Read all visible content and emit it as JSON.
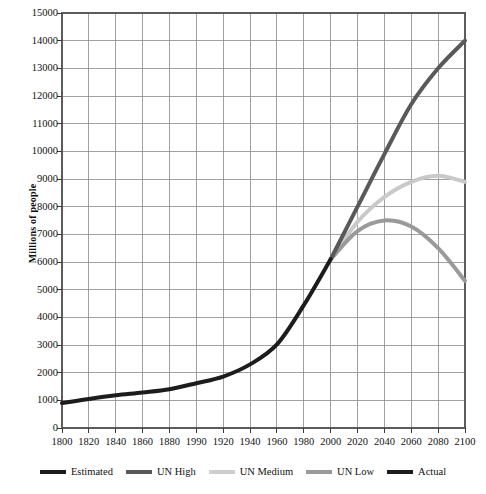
{
  "chart_data": {
    "type": "line",
    "title": "",
    "xlabel": "",
    "ylabel": "Millions of people",
    "xlim": [
      1800,
      2100
    ],
    "ylim": [
      0,
      15000
    ],
    "grid": true,
    "legend_position": "bottom",
    "x_tick_labels": [
      "1800",
      "1820",
      "1840",
      "1860",
      "1880",
      "1990",
      "1920",
      "1940",
      "1960",
      "1980",
      "2000",
      "2020",
      "2040",
      "2060",
      "2080",
      "2100"
    ],
    "x_tick_values": [
      1800,
      1820,
      1840,
      1860,
      1880,
      1900,
      1920,
      1940,
      1960,
      1980,
      2000,
      2020,
      2040,
      2060,
      2080,
      2100
    ],
    "y_tick_labels": [
      "0",
      "1000",
      "2000",
      "3000",
      "4000",
      "5000",
      "6000",
      "7000",
      "8000",
      "9000",
      "10000",
      "11000",
      "12000",
      "13000",
      "14000",
      "15000"
    ],
    "y_tick_values": [
      0,
      1000,
      2000,
      3000,
      4000,
      5000,
      6000,
      7000,
      8000,
      9000,
      10000,
      11000,
      12000,
      13000,
      14000,
      15000
    ],
    "series": [
      {
        "name": "Estimated",
        "color": "#1c1c1c",
        "width": 4,
        "x": [
          1800,
          1820,
          1840,
          1860,
          1880,
          1900,
          1920,
          1940,
          1960,
          1980,
          2000
        ],
        "values": [
          900,
          1050,
          1180,
          1280,
          1400,
          1620,
          1860,
          2300,
          3020,
          4440,
          6100
        ]
      },
      {
        "name": "UN High",
        "color": "#595959",
        "width": 4,
        "x": [
          2000,
          2020,
          2040,
          2060,
          2080,
          2100
        ],
        "values": [
          6100,
          8000,
          9900,
          11700,
          13000,
          14000
        ]
      },
      {
        "name": "UN Medium",
        "color": "#c9c9c9",
        "width": 4,
        "x": [
          2000,
          2020,
          2040,
          2060,
          2080,
          2100
        ],
        "values": [
          6100,
          7450,
          8350,
          8900,
          9120,
          8900
        ]
      },
      {
        "name": "UN Low",
        "color": "#9a9a9a",
        "width": 4,
        "x": [
          2000,
          2020,
          2040,
          2060,
          2080,
          2100
        ],
        "values": [
          6100,
          7120,
          7500,
          7280,
          6500,
          5320
        ]
      },
      {
        "name": "Actual",
        "color": "#1c1c1c",
        "width": 4,
        "x": [],
        "values": []
      }
    ],
    "annotations": []
  },
  "legend": {
    "items": [
      {
        "label": "Estimated",
        "color": "#1c1c1c"
      },
      {
        "label": "UN High",
        "color": "#5a5a5a"
      },
      {
        "label": "UN Medium",
        "color": "#cfcfcf"
      },
      {
        "label": "UN Low",
        "color": "#9a9a9a"
      },
      {
        "label": "Actual",
        "color": "#1c1c1c"
      }
    ]
  },
  "axis_style": {
    "grid_color": "#8a8a8a",
    "frame_color": "#5c5c5c",
    "tick_color": "#3a3a3a"
  }
}
